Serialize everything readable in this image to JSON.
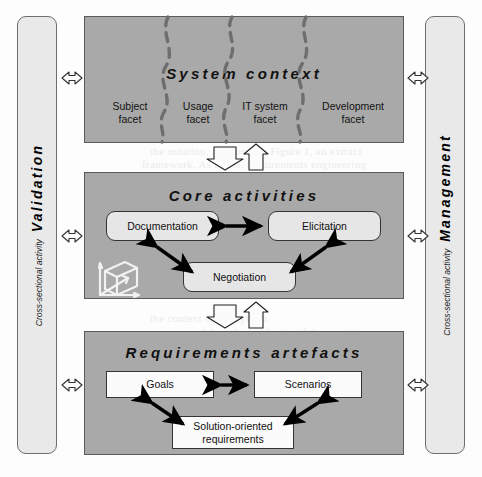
{
  "diagram": {
    "canvas": {
      "width": 482,
      "height": 477
    },
    "colors": {
      "panel_gray": "#a9a9a9",
      "sidebar_gray": "#e9e9e9",
      "node_rounded": "#e6e6e6",
      "node_sharp": "#fbfbfb",
      "outline": "#333333",
      "dashed_divider": "#6e6e6e",
      "arrow_solid": "#000000",
      "arrow_outline": "#111111"
    }
  },
  "left_sidebar": {
    "name": "validation-activity-bar",
    "small_label": "Cross-sectional activity",
    "big_label": "Validation"
  },
  "right_sidebar": {
    "name": "management-activity-bar",
    "small_label": "Cross-sectional activity",
    "big_label": "Management"
  },
  "panels": [
    {
      "id": "system-context",
      "title": "System context",
      "facets": [
        {
          "line1": "Subject",
          "line2": "facet"
        },
        {
          "line1": "Usage",
          "line2": "facet"
        },
        {
          "line1": "IT system",
          "line2": "facet"
        },
        {
          "line1": "Development",
          "line2": "facet"
        }
      ]
    },
    {
      "id": "core-activities",
      "title": "Core activities",
      "nodes": [
        {
          "id": "documentation",
          "label": "Documentation"
        },
        {
          "id": "elicitation",
          "label": "Elicitation"
        },
        {
          "id": "negotiation",
          "label": "Negotiation"
        }
      ],
      "icon": "3d-axes-cube-icon"
    },
    {
      "id": "requirements-artefacts",
      "title": "Requirements artefacts",
      "nodes": [
        {
          "id": "goals",
          "label": "Goals"
        },
        {
          "id": "scenarios",
          "label": "Scenarios"
        },
        {
          "id": "solution-oriented-requirements",
          "label_line1": "Solution-oriented",
          "label_line2": "requirements"
        }
      ]
    }
  ],
  "connectors": {
    "vertical_pairs": [
      {
        "name": "context-to-activities",
        "down": "block-arrow-down",
        "up": "block-arrow-up"
      },
      {
        "name": "activities-to-artefacts",
        "down": "block-arrow-down",
        "up": "block-arrow-up"
      }
    ],
    "side_arrows": [
      {
        "name": "validation-system-context-link",
        "glyph": "double-headed-arrow-horizontal"
      },
      {
        "name": "validation-core-activities-link",
        "glyph": "double-headed-arrow-horizontal"
      },
      {
        "name": "validation-artefacts-link",
        "glyph": "double-headed-arrow-horizontal"
      },
      {
        "name": "management-system-context-link",
        "glyph": "double-headed-arrow-horizontal"
      },
      {
        "name": "management-core-activities-link",
        "glyph": "double-headed-arrow-horizontal"
      },
      {
        "name": "management-artefacts-link",
        "glyph": "double-headed-arrow-horizontal"
      }
    ],
    "inner_arrows": [
      {
        "name": "documentation-elicitation-arrow",
        "from": "documentation",
        "to": "elicitation",
        "style": "double-headed"
      },
      {
        "name": "documentation-negotiation-arrow",
        "from": "documentation",
        "to": "negotiation",
        "style": "double-headed"
      },
      {
        "name": "elicitation-negotiation-arrow",
        "from": "elicitation",
        "to": "negotiation",
        "style": "double-headed"
      },
      {
        "name": "goals-scenarios-arrow",
        "from": "goals",
        "to": "scenarios",
        "style": "double-headed"
      },
      {
        "name": "goals-solution-arrow",
        "from": "goals",
        "to": "solution-oriented-requirements",
        "style": "double-headed"
      },
      {
        "name": "scenarios-solution-arrow",
        "from": "scenarios",
        "to": "solution-oriented-requirements",
        "style": "double-headed"
      }
    ]
  },
  "background_bleed": [
    {
      "text": "3 For",
      "x": 318,
      "y": 38
    },
    {
      "text": "the notation, as shown in Figure 1, an extract",
      "x": 150,
      "y": 145
    },
    {
      "text": "framework. As a rule, requirements engineering",
      "x": 142,
      "y": 158
    },
    {
      "text": "the context of the system",
      "x": 150,
      "y": 312
    },
    {
      "text": "and the relevant facets of the context",
      "x": 188,
      "y": 326
    }
  ]
}
